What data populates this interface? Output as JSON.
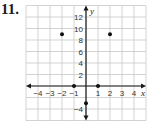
{
  "problem": {
    "number": "11."
  },
  "chart_data": {
    "type": "scatter",
    "title": "",
    "xlabel": "x",
    "ylabel": "y",
    "xlim": [
      -5,
      5
    ],
    "ylim": [
      -6,
      14
    ],
    "grid": true,
    "x_ticks": [
      -4,
      -3,
      -2,
      -1,
      1,
      2,
      3,
      4
    ],
    "x_tick_labels": [
      "−4",
      "−3",
      "−2",
      "−1",
      "1",
      "2",
      "3",
      "4"
    ],
    "y_ticks": [
      12,
      10,
      8,
      6,
      4,
      2,
      -4
    ],
    "y_tick_labels": [
      "12",
      "10",
      "8",
      "6",
      "4",
      "2",
      "−4"
    ],
    "series": [
      {
        "name": "points",
        "x": [
          -2,
          2,
          -1,
          1,
          0
        ],
        "y": [
          9,
          9,
          0,
          0,
          -3
        ]
      }
    ],
    "colors": {
      "grid": "#c8c8c8",
      "axis": "#1a1a1a",
      "point": "#111111"
    }
  }
}
